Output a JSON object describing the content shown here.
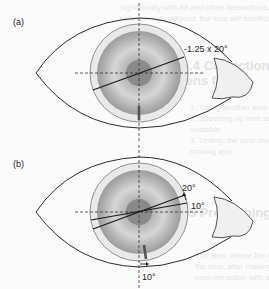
{
  "figure": {
    "panel_a": {
      "label": "(a)",
      "axis_annotation": "-1.25 x 20°",
      "axis_angle_deg": 20
    },
    "panel_b": {
      "label": "(b)",
      "rotated_axis_label": "20°",
      "original_axis_label": "10°",
      "marker_rotation_label": "10°",
      "lines_deg": [
        10,
        20
      ]
    },
    "colors": {
      "outline": "#2a2a2a",
      "lens_edge": "#c8c8c8",
      "iris_outer": "#9a9a9a",
      "iris_mid": "#d4d4d4",
      "pupil": "#8a8a8a",
      "marker": "#555555"
    }
  },
  "bleed_text": {
    "l1": "significantly with lid and other interactions. Once w",
    "l2": "lens correctly aligned, the lens will stabilize. Con",
    "l3": "patterns.",
    "h1": "5.4  Correction of toric soft",
    "h2": "lens fitting",
    "l4": "1. Trying another toric lens design which will sit",
    "l5": "2. Speeding up lens settling. When lens is unstab",
    "l6": "   unstable",
    "l7": "3. Tinting: the lens moves, and the same rotation",
    "l8": "   moving lens",
    "h3": "5.5  Prescribing after fitting",
    "l9": "The lens, where the lens rotation is of sufficient",
    "l10": "the lens, after making adjustment of the axis at",
    "l11": "over-refraction with a toric lens in position and"
  }
}
